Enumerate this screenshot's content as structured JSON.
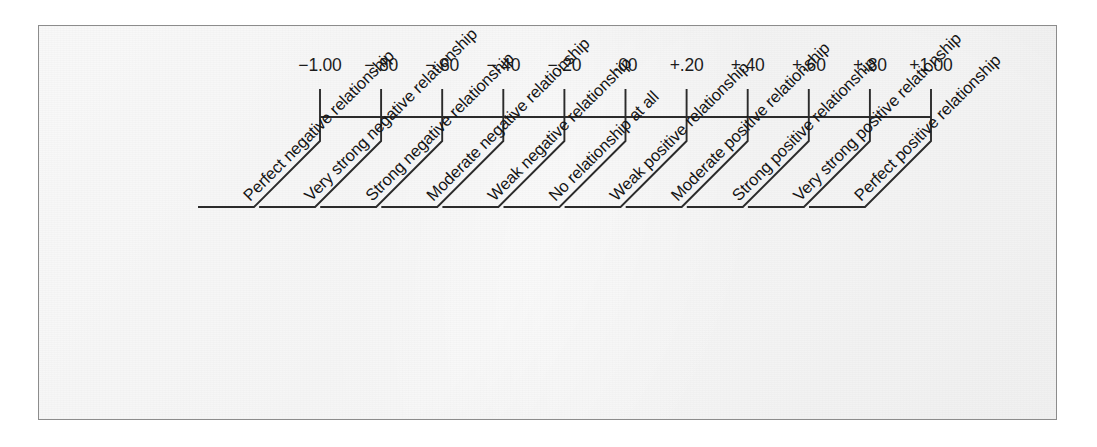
{
  "figure": {
    "frame_color": "#8c8c8c",
    "paper_color": "#ececec",
    "ink_color": "#2b2b2b"
  },
  "chart_data": {
    "type": "scatter",
    "title": "",
    "subtitle": "",
    "xlabel": "",
    "ylabel": "",
    "xlim": [
      -1.0,
      1.0
    ],
    "grid": false,
    "legend_position": "none",
    "axis_orientation": "horizontal",
    "tick_values": [
      -1.0,
      -0.8,
      -0.6,
      -0.4,
      -0.2,
      0.0,
      0.2,
      0.4,
      0.6,
      0.8,
      1.0
    ],
    "tick_labels": [
      "−1.00",
      "−.80",
      "−.60",
      "−.40",
      "−.20",
      ".00",
      "+.20",
      "+.40",
      "+.60",
      "+.80",
      "+1.00"
    ],
    "annotations": [
      "Perfect negative relationship",
      "Very strong negative relationship",
      "Strong negative relationship",
      "Moderate negative relationship",
      "Weak negative relationship",
      "No relationship at all",
      "Weak positive relationship",
      "Moderate positive relationship",
      "Strong positive relationship",
      "Very strong positive relationship",
      "Perfect positive relationship"
    ],
    "points": [
      {
        "value": -1.0,
        "tick_label": "−1.00",
        "description": "Perfect negative relationship"
      },
      {
        "value": -0.8,
        "tick_label": "−.80",
        "description": "Very strong negative relationship"
      },
      {
        "value": -0.6,
        "tick_label": "−.60",
        "description": "Strong negative relationship"
      },
      {
        "value": -0.4,
        "tick_label": "−.40",
        "description": "Moderate negative relationship"
      },
      {
        "value": -0.2,
        "tick_label": "−.20",
        "description": "Weak negative relationship"
      },
      {
        "value": 0.0,
        "tick_label": ".00",
        "description": "No relationship at all"
      },
      {
        "value": 0.2,
        "tick_label": "+.20",
        "description": "Weak positive relationship"
      },
      {
        "value": 0.4,
        "tick_label": "+.40",
        "description": "Moderate positive relationship"
      },
      {
        "value": 0.6,
        "tick_label": "+.60",
        "description": "Strong positive relationship"
      },
      {
        "value": 0.8,
        "tick_label": "+.80",
        "description": "Very strong positive relationship"
      },
      {
        "value": 1.0,
        "tick_label": "+1.00",
        "description": "Perfect positive relationship"
      }
    ]
  }
}
